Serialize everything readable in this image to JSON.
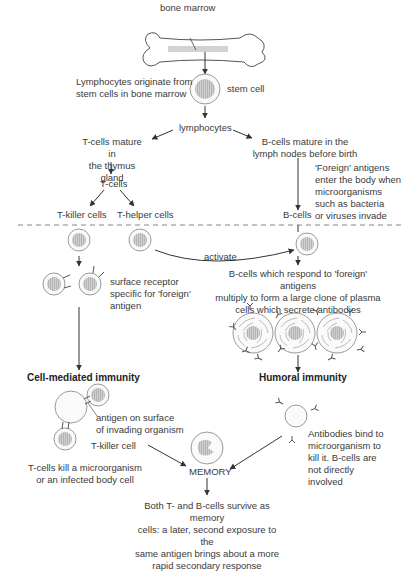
{
  "diagram": {
    "labels": {
      "bone_marrow": "bone marrow",
      "stem_cell": "stem cell",
      "lymphocytes_origin": "Lymphocytes originate from\nstem cells in bone marrow",
      "lymphocytes": "lymphocytes",
      "t_cells_mature": "T-cells mature in\nthe thymus gland",
      "b_cells_mature": "B-cells mature in the\nlymph nodes before birth",
      "t_cells": "T-cells",
      "foreign_antigens_enter": "'Foreign' antigens\nenter the body when\nmicroorganisms\nsuch as bacteria\nor viruses invade",
      "b_cells": "B-cells",
      "t_killer_cells": "T-killer cells",
      "t_helper_cells": "T-helper cells",
      "activate": "activate",
      "surface_receptor": "surface receptor\nspecific for 'foreign'\nantigen",
      "b_cells_respond": "B-cells which respond to 'foreign' antigens\nmultiply to form a large clone of plasma\ncells which secrete antibodies",
      "cell_mediated_immunity": "Cell-mediated immunity",
      "humoral_immunity": "Humoral immunity",
      "antigen_on_surface": "antigen on surface\nof invading organism",
      "t_killer_cell": "T-killer cell",
      "t_cells_kill": "T-cells kill a microorganism\nor an infected body cell",
      "memory": "MEMORY",
      "antibodies_bind": "Antibodies bind to\nmicroorganism to\nkill it. B-cells are\nnot directly\ninvolved",
      "memory_description": "Both T- and B-cells survive as memory\ncells: a later, second exposure to the\nsame antigen brings about a more\nrapid secondary response"
    },
    "colors": {
      "line": "#333333",
      "cell_outline": "#9a9a9a",
      "nucleus": "#c8c8c8",
      "divider": "#888888",
      "text": "#3a3a3a"
    }
  }
}
